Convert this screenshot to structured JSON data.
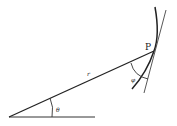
{
  "diagram": {
    "type": "polar-curve-tangent-angle",
    "labels": {
      "point": "P",
      "radius": "r",
      "polar_angle": "θ",
      "tangent_angle": "φ"
    },
    "colors": {
      "line": "#222222",
      "background": "#ffffff"
    }
  }
}
